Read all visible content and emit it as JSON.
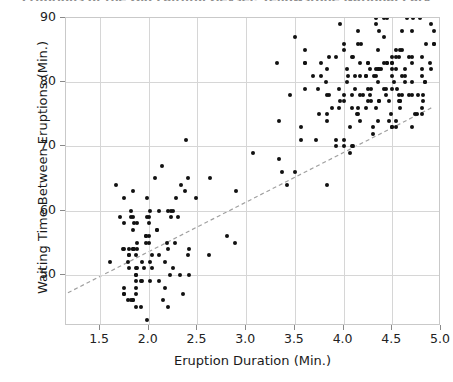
{
  "chart_data": {
    "type": "scatter",
    "title": "Eruptions of the Old Faithful Geyser, Yellowstone National Park",
    "xlabel": "Eruption Duration (Min.)",
    "ylabel": "Waiting Time Between Eruptions (Min.)",
    "xlim": [
      1.15,
      5.0
    ],
    "ylim": [
      42.0,
      90.0
    ],
    "xticks": [
      1.5,
      2.0,
      2.5,
      3.0,
      3.5,
      4.0,
      4.5,
      5.0
    ],
    "xticklabels": [
      "1.5",
      "2.0",
      "2.5",
      "3.0",
      "3.5",
      "4.0",
      "4.5",
      "5.0"
    ],
    "yticks": [
      50,
      60,
      70,
      80,
      90
    ],
    "yticklabels": [
      "50",
      "60",
      "70",
      "80",
      "90"
    ],
    "grid": true,
    "legend": "none",
    "marker_color": "#111111",
    "marker_size_px": 4,
    "trendline": {
      "style": "dashed",
      "color": "#a0a0a0",
      "x": [
        1.17,
        4.92
      ],
      "y": [
        46.9,
        75.9
      ]
    },
    "points": [
      [
        3.6,
        79
      ],
      [
        1.8,
        54
      ],
      [
        3.333,
        74
      ],
      [
        2.283,
        62
      ],
      [
        4.533,
        85
      ],
      [
        2.883,
        55
      ],
      [
        4.7,
        88
      ],
      [
        3.6,
        85
      ],
      [
        1.95,
        51
      ],
      [
        4.35,
        85
      ],
      [
        1.833,
        54
      ],
      [
        3.917,
        84
      ],
      [
        4.2,
        78
      ],
      [
        1.75,
        47
      ],
      [
        4.7,
        83
      ],
      [
        2.167,
        52
      ],
      [
        1.75,
        62
      ],
      [
        4.8,
        84
      ],
      [
        1.6,
        52
      ],
      [
        4.25,
        79
      ],
      [
        1.8,
        51
      ],
      [
        1.75,
        47
      ],
      [
        3.45,
        78
      ],
      [
        3.067,
        69
      ],
      [
        4.533,
        74
      ],
      [
        3.6,
        83
      ],
      [
        1.967,
        55
      ],
      [
        4.083,
        76
      ],
      [
        3.85,
        78
      ],
      [
        4.433,
        79
      ],
      [
        4.3,
        73
      ],
      [
        4.467,
        77
      ],
      [
        3.367,
        66
      ],
      [
        4.033,
        80
      ],
      [
        3.833,
        74
      ],
      [
        2.017,
        52
      ],
      [
        1.867,
        48
      ],
      [
        4.833,
        80
      ],
      [
        1.833,
        59
      ],
      [
        4.783,
        90
      ],
      [
        4.35,
        80
      ],
      [
        1.883,
        58
      ],
      [
        4.567,
        84
      ],
      [
        1.75,
        58
      ],
      [
        4.533,
        73
      ],
      [
        3.317,
        83
      ],
      [
        3.833,
        64
      ],
      [
        2.1,
        53
      ],
      [
        4.633,
        82
      ],
      [
        2.0,
        59
      ],
      [
        4.8,
        75
      ],
      [
        4.716,
        90
      ],
      [
        1.833,
        54
      ],
      [
        4.833,
        80
      ],
      [
        1.733,
        54
      ],
      [
        4.883,
        83
      ],
      [
        3.717,
        71
      ],
      [
        1.667,
        64
      ],
      [
        4.567,
        77
      ],
      [
        4.317,
        81
      ],
      [
        2.233,
        59
      ],
      [
        4.5,
        84
      ],
      [
        1.75,
        48
      ],
      [
        4.8,
        82
      ],
      [
        1.817,
        60
      ],
      [
        4.4,
        92
      ],
      [
        4.167,
        78
      ],
      [
        4.7,
        78
      ],
      [
        2.067,
        65
      ],
      [
        4.7,
        73
      ],
      [
        4.033,
        82
      ],
      [
        1.967,
        56
      ],
      [
        4.5,
        79
      ],
      [
        4.0,
        71
      ],
      [
        1.983,
        62
      ],
      [
        5.067,
        76
      ],
      [
        2.017,
        60
      ],
      [
        4.567,
        78
      ],
      [
        3.883,
        76
      ],
      [
        3.6,
        83
      ],
      [
        4.133,
        75
      ],
      [
        4.333,
        82
      ],
      [
        4.1,
        70
      ],
      [
        2.633,
        65
      ],
      [
        4.067,
        73
      ],
      [
        4.933,
        88
      ],
      [
        3.95,
        76
      ],
      [
        4.517,
        80
      ],
      [
        2.167,
        48
      ],
      [
        4.0,
        86
      ],
      [
        2.2,
        60
      ],
      [
        4.333,
        90
      ],
      [
        1.867,
        50
      ],
      [
        4.817,
        78
      ],
      [
        1.833,
        63
      ],
      [
        4.3,
        72
      ],
      [
        4.667,
        84
      ],
      [
        3.75,
        75
      ],
      [
        1.867,
        51
      ],
      [
        4.9,
        82
      ],
      [
        2.483,
        62
      ],
      [
        4.367,
        88
      ],
      [
        2.1,
        49
      ],
      [
        4.5,
        83
      ],
      [
        4.05,
        81
      ],
      [
        1.867,
        47
      ],
      [
        4.7,
        84
      ],
      [
        1.783,
        52
      ],
      [
        4.85,
        86
      ],
      [
        3.683,
        81
      ],
      [
        4.733,
        75
      ],
      [
        2.3,
        59
      ],
      [
        4.9,
        89
      ],
      [
        4.417,
        79
      ],
      [
        1.7,
        59
      ],
      [
        4.633,
        81
      ],
      [
        2.317,
        50
      ],
      [
        4.6,
        85
      ],
      [
        1.817,
        59
      ],
      [
        4.417,
        87
      ],
      [
        2.617,
        53
      ],
      [
        4.067,
        69
      ],
      [
        4.25,
        77
      ],
      [
        1.967,
        56
      ],
      [
        4.6,
        88
      ],
      [
        3.767,
        81
      ],
      [
        1.917,
        45
      ],
      [
        4.5,
        82
      ],
      [
        2.267,
        55
      ],
      [
        4.65,
        90
      ],
      [
        1.867,
        45
      ],
      [
        4.167,
        83
      ],
      [
        2.8,
        56
      ],
      [
        4.333,
        89
      ],
      [
        1.833,
        46
      ],
      [
        4.383,
        82
      ],
      [
        1.883,
        51
      ],
      [
        4.933,
        86
      ],
      [
        2.033,
        53
      ],
      [
        3.733,
        79
      ],
      [
        4.233,
        81
      ],
      [
        2.233,
        60
      ],
      [
        4.533,
        82
      ],
      [
        4.817,
        77
      ],
      [
        4.333,
        76
      ],
      [
        1.983,
        59
      ],
      [
        4.633,
        80
      ],
      [
        2.017,
        49
      ],
      [
        5.1,
        96
      ],
      [
        1.8,
        53
      ],
      [
        5.033,
        77
      ],
      [
        4.0,
        77
      ],
      [
        2.4,
        65
      ],
      [
        4.6,
        81
      ],
      [
        3.567,
        71
      ],
      [
        4.0,
        70
      ],
      [
        4.5,
        81
      ],
      [
        4.083,
        93
      ],
      [
        1.8,
        53
      ],
      [
        3.967,
        89
      ],
      [
        2.2,
        45
      ],
      [
        4.15,
        86
      ],
      [
        2.0,
        58
      ],
      [
        3.833,
        78
      ],
      [
        3.5,
        66
      ],
      [
        4.583,
        76
      ],
      [
        2.367,
        63
      ],
      [
        5.0,
        88
      ],
      [
        1.933,
        52
      ],
      [
        4.617,
        93
      ],
      [
        1.917,
        49
      ],
      [
        2.083,
        57
      ],
      [
        4.583,
        77
      ],
      [
        3.333,
        68
      ],
      [
        4.167,
        81
      ],
      [
        4.333,
        81
      ],
      [
        4.5,
        73
      ],
      [
        2.417,
        50
      ],
      [
        4.0,
        85
      ],
      [
        4.167,
        74
      ],
      [
        1.883,
        55
      ],
      [
        4.583,
        77
      ],
      [
        4.25,
        83
      ],
      [
        3.767,
        83
      ],
      [
        2.033,
        51
      ],
      [
        4.433,
        78
      ],
      [
        4.083,
        84
      ],
      [
        1.833,
        46
      ],
      [
        4.417,
        83
      ],
      [
        2.183,
        55
      ],
      [
        4.8,
        81
      ],
      [
        1.833,
        57
      ],
      [
        4.8,
        76
      ],
      [
        4.1,
        84
      ],
      [
        3.966,
        77
      ],
      [
        4.233,
        81
      ],
      [
        3.5,
        87
      ],
      [
        4.366,
        77
      ],
      [
        2.25,
        51
      ],
      [
        4.667,
        78
      ],
      [
        2.1,
        60
      ],
      [
        4.35,
        82
      ],
      [
        4.133,
        91
      ],
      [
        1.867,
        53
      ],
      [
        4.6,
        78
      ],
      [
        1.783,
        46
      ],
      [
        4.367,
        77
      ],
      [
        3.85,
        84
      ],
      [
        1.933,
        49
      ],
      [
        4.5,
        83
      ],
      [
        2.383,
        71
      ],
      [
        4.7,
        80
      ],
      [
        1.867,
        49
      ],
      [
        3.833,
        75
      ],
      [
        3.417,
        64
      ],
      [
        4.233,
        76
      ],
      [
        2.4,
        53
      ],
      [
        4.8,
        94
      ],
      [
        2.0,
        55
      ],
      [
        4.15,
        76
      ],
      [
        1.867,
        50
      ],
      [
        4.267,
        82
      ],
      [
        1.75,
        54
      ],
      [
        4.483,
        75
      ],
      [
        4.0,
        78
      ],
      [
        4.117,
        79
      ],
      [
        4.083,
        78
      ],
      [
        4.267,
        78
      ],
      [
        3.917,
        70
      ],
      [
        4.55,
        79
      ],
      [
        4.083,
        70
      ],
      [
        2.417,
        54
      ],
      [
        4.183,
        86
      ],
      [
        2.217,
        50
      ],
      [
        4.45,
        90
      ],
      [
        1.883,
        54
      ],
      [
        1.85,
        54
      ],
      [
        4.283,
        77
      ],
      [
        3.95,
        79
      ],
      [
        2.333,
        64
      ],
      [
        4.15,
        75
      ],
      [
        2.35,
        47
      ],
      [
        4.933,
        86
      ],
      [
        2.9,
        63
      ],
      [
        4.583,
        85
      ],
      [
        3.833,
        82
      ],
      [
        2.083,
        57
      ],
      [
        4.367,
        82
      ],
      [
        2.133,
        67
      ],
      [
        4.35,
        74
      ],
      [
        2.2,
        54
      ],
      [
        4.45,
        83
      ],
      [
        3.567,
        73
      ],
      [
        4.5,
        73
      ],
      [
        4.15,
        88
      ],
      [
        3.817,
        80
      ],
      [
        3.917,
        71
      ],
      [
        4.45,
        83
      ],
      [
        2.0,
        56
      ],
      [
        4.283,
        79
      ],
      [
        4.767,
        78
      ],
      [
        4.533,
        84
      ],
      [
        1.85,
        58
      ],
      [
        4.25,
        83
      ],
      [
        1.983,
        43
      ],
      [
        2.25,
        60
      ],
      [
        4.75,
        75
      ],
      [
        4.117,
        81
      ],
      [
        2.15,
        46
      ],
      [
        4.417,
        90
      ],
      [
        1.817,
        46
      ],
      [
        4.467,
        74
      ]
    ]
  }
}
